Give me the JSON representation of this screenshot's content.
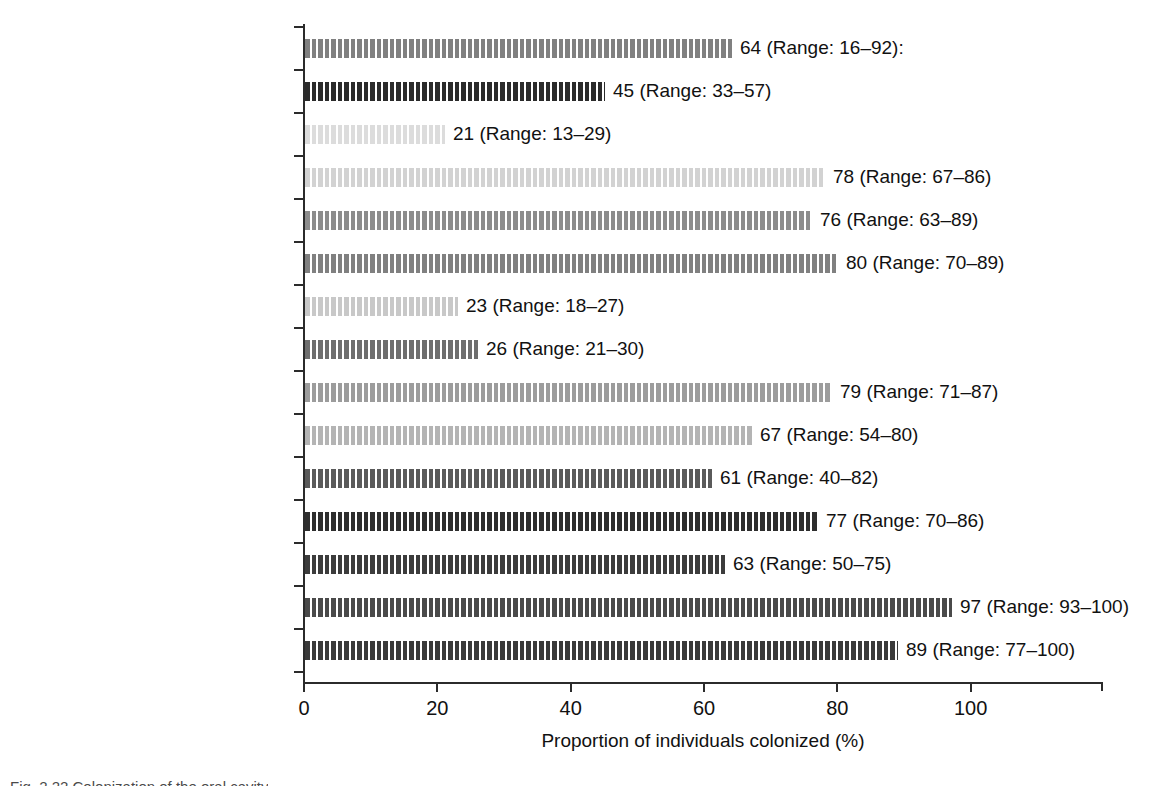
{
  "chart_data": {
    "type": "bar",
    "orientation": "horizontal",
    "title": "",
    "xlabel": "Proportion of individuals colonized (%)",
    "ylabel": "",
    "xlim": [
      0,
      120
    ],
    "xticks": [
      0,
      20,
      40,
      60,
      80,
      100
    ],
    "xticklabels": [
      "0",
      "20",
      "40",
      "60",
      "80",
      "100"
    ],
    "grid": false,
    "legend": null,
    "categories": [
      "Helicobacter pylori",
      "Bacteroides",
      "Fusobacterium spp.",
      "Veillonella spp.",
      "Actinomyces",
      "Gram-positive anaerobic cocci",
      "Yeasts",
      "Enterobacteriaceae",
      "Neisseria spp.",
      "Haemophilus spp.",
      "Micrococcus",
      "Staphylococcus spp.",
      "Streptococcus sanguis",
      "Streptococcus mitior",
      "Streptococcus salivarius"
    ],
    "values": [
      64,
      45,
      21,
      78,
      76,
      80,
      23,
      26,
      79,
      67,
      61,
      77,
      63,
      97,
      89
    ],
    "ranges": [
      [
        16,
        92
      ],
      [
        33,
        57
      ],
      [
        13,
        29
      ],
      [
        67,
        86
      ],
      [
        63,
        89
      ],
      [
        70,
        89
      ],
      [
        18,
        27
      ],
      [
        21,
        30
      ],
      [
        71,
        87
      ],
      [
        54,
        80
      ],
      [
        40,
        82
      ],
      [
        70,
        86
      ],
      [
        50,
        75
      ],
      [
        93,
        100
      ],
      [
        77,
        100
      ]
    ],
    "rows": [
      {
        "genus": "Helicobacter pylori",
        "suffix": "",
        "italic": true,
        "value": 64,
        "value_label": "64 (Range: 16–92):",
        "color": "#808080"
      },
      {
        "genus": "Bacteroides",
        "suffix": "",
        "italic": true,
        "value": 45,
        "value_label": "45 (Range: 33–57)",
        "color": "#2b2b2b"
      },
      {
        "genus": "Fusobacterium",
        "suffix": " spp.",
        "italic": true,
        "value": 21,
        "value_label": "21 (Range: 13–29)",
        "color": "#dcdcdc"
      },
      {
        "genus": "Veillonella",
        "suffix": " spp.",
        "italic": true,
        "value": 78,
        "value_label": "78 (Range: 67–86)",
        "color": "#d2d2d2"
      },
      {
        "genus": "Actinomyces",
        "suffix": "",
        "italic": true,
        "value": 76,
        "value_label": "76 (Range: 63–89)",
        "color": "#8c8c8c"
      },
      {
        "genus": "Gram-positive anaerobic cocci",
        "suffix": "",
        "italic": false,
        "value": 80,
        "value_label": "80 (Range: 70–89)",
        "color": "#808080"
      },
      {
        "genus": "Yeasts",
        "suffix": "",
        "italic": false,
        "value": 23,
        "value_label": "23 (Range: 18–27)",
        "color": "#c8c8c8"
      },
      {
        "genus": "Enterobacteriaceae",
        "suffix": "",
        "italic": true,
        "value": 26,
        "value_label": "26 (Range: 21–30)",
        "color": "#6e6e6e"
      },
      {
        "genus": "Neisseria",
        "suffix": " spp.",
        "italic": true,
        "value": 79,
        "value_label": "79 (Range: 71–87)",
        "color": "#9c9c9c"
      },
      {
        "genus": "Haemophilus",
        "suffix": " spp.",
        "italic": true,
        "value": 67,
        "value_label": "67 (Range: 54–80)",
        "color": "#b4b4b4"
      },
      {
        "genus": "Micrococcus",
        "suffix": "",
        "italic": true,
        "value": 61,
        "value_label": "61 (Range: 40–82)",
        "color": "#5a5a5a"
      },
      {
        "genus": "Staphylococcus",
        "suffix": " spp.",
        "italic": true,
        "value": 77,
        "value_label": "77 (Range: 70–86)",
        "color": "#2e2e2e"
      },
      {
        "genus": "Streptococcus sanguis",
        "suffix": "",
        "italic": true,
        "value": 63,
        "value_label": "63 (Range: 50–75)",
        "color": "#3c3c3c"
      },
      {
        "genus": "Streptococcus mitior",
        "suffix": "",
        "italic": true,
        "value": 97,
        "value_label": "97 (Range: 93–100)",
        "color": "#4a4a4a"
      },
      {
        "genus": "Streptococcus salivarius",
        "suffix": "",
        "italic": true,
        "value": 89,
        "value_label": "89 (Range: 77–100)",
        "color": "#3a3a3a"
      }
    ]
  },
  "figure": {
    "caption": "Fig. 2.22 Colonization of the oral cavity",
    "axis_color": "#2b2b2b"
  }
}
